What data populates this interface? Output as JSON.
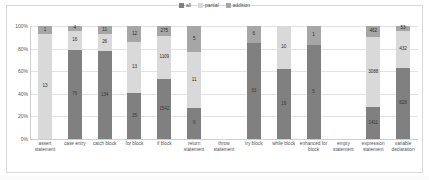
{
  "legend": {
    "position": "top-center",
    "items": [
      {
        "label": "all",
        "color": "#808080"
      },
      {
        "label": "partial",
        "color": "#d9d9d9"
      },
      {
        "label": "addition",
        "color": "#a6a6a6"
      }
    ]
  },
  "axis": {
    "y_ticks": [
      "0%",
      "20%",
      "40%",
      "60%",
      "80%",
      "100%"
    ],
    "ylabel": "",
    "xlabel": ""
  },
  "chart_data": {
    "type": "bar",
    "stacked": true,
    "normalized": true,
    "title": "",
    "subtitle": "",
    "xlabel": "",
    "ylabel": "",
    "ylim": [
      0,
      100
    ],
    "ytick_labels": [
      "0%",
      "20%",
      "40%",
      "60%",
      "80%",
      "100%"
    ],
    "grid": true,
    "legend_position": "top-center",
    "categories": [
      "assert statement",
      "case entry",
      "catch block",
      "for block",
      "if block",
      "return statement",
      "throw statement",
      "try block",
      "while block",
      "enhanced for block",
      "empty statement",
      "expression statement",
      "variable declaration"
    ],
    "series": [
      {
        "name": "all",
        "color": "#808080",
        "values": [
          0,
          76,
          134,
          1542,
          1542,
          6,
          0,
          33,
          16,
          5,
          0,
          1411,
          828
        ]
      },
      {
        "name": "partial",
        "color": "#d9d9d9",
        "values": [
          13,
          16,
          26,
          13,
          1109,
          11,
          0,
          0,
          10,
          0,
          0,
          3088,
          432
        ]
      },
      {
        "name": "addition",
        "color": "#a6a6a6",
        "values": [
          1,
          4,
          11,
          12,
          275,
          5,
          0,
          6,
          0,
          1,
          0,
          462,
          53
        ]
      }
    ],
    "bars": [
      {
        "category": "assert statement",
        "segments": [
          {
            "series": "all",
            "value": 0,
            "label": "",
            "percent": 0
          },
          {
            "series": "partial",
            "value": 13,
            "label": "13",
            "percent": 93
          },
          {
            "series": "addition",
            "value": 1,
            "label": "1",
            "percent": 7
          }
        ]
      },
      {
        "category": "case entry",
        "segments": [
          {
            "series": "all",
            "value": 76,
            "label": "76",
            "percent": 79
          },
          {
            "series": "partial",
            "value": 16,
            "label": "16",
            "percent": 17
          },
          {
            "series": "addition",
            "value": 4,
            "label": "4",
            "percent": 4
          }
        ]
      },
      {
        "category": "catch block",
        "segments": [
          {
            "series": "all",
            "value": 134,
            "label": "134",
            "percent": 78
          },
          {
            "series": "partial",
            "value": 26,
            "label": "26",
            "percent": 15
          },
          {
            "series": "addition",
            "value": 11,
            "label": "11",
            "percent": 7
          }
        ]
      },
      {
        "category": "for block",
        "segments": [
          {
            "series": "all",
            "value": 35,
            "label": "35",
            "percent": 41
          },
          {
            "series": "partial",
            "value": 13,
            "label": "13",
            "percent": 45
          },
          {
            "series": "addition",
            "value": 12,
            "label": "12",
            "percent": 14
          }
        ]
      },
      {
        "category": "if block",
        "segments": [
          {
            "series": "all",
            "value": 1542,
            "label": "1542",
            "percent": 53
          },
          {
            "series": "partial",
            "value": 1109,
            "label": "1109",
            "percent": 38
          },
          {
            "series": "addition",
            "value": 275,
            "label": "275",
            "percent": 9
          }
        ]
      },
      {
        "category": "return statement",
        "segments": [
          {
            "series": "all",
            "value": 6,
            "label": "6",
            "percent": 27
          },
          {
            "series": "partial",
            "value": 11,
            "label": "11",
            "percent": 50
          },
          {
            "series": "addition",
            "value": 5,
            "label": "5",
            "percent": 23
          }
        ]
      },
      {
        "category": "throw statement",
        "segments": []
      },
      {
        "category": "try block",
        "segments": [
          {
            "series": "all",
            "value": 33,
            "label": "33",
            "percent": 85
          },
          {
            "series": "partial",
            "value": 0,
            "label": "",
            "percent": 0
          },
          {
            "series": "addition",
            "value": 6,
            "label": "6",
            "percent": 15
          }
        ]
      },
      {
        "category": "while block",
        "segments": [
          {
            "series": "all",
            "value": 16,
            "label": "16",
            "percent": 62
          },
          {
            "series": "partial",
            "value": 10,
            "label": "10",
            "percent": 38
          },
          {
            "series": "addition",
            "value": 0,
            "label": "",
            "percent": 0
          }
        ]
      },
      {
        "category": "enhanced for block",
        "segments": [
          {
            "series": "all",
            "value": 5,
            "label": "5",
            "percent": 83
          },
          {
            "series": "partial",
            "value": 0,
            "label": "",
            "percent": 0
          },
          {
            "series": "addition",
            "value": 1,
            "label": "1",
            "percent": 17
          }
        ]
      },
      {
        "category": "empty statement",
        "segments": []
      },
      {
        "category": "expression statement",
        "segments": [
          {
            "series": "all",
            "value": 1411,
            "label": "1411",
            "percent": 28
          },
          {
            "series": "partial",
            "value": 3088,
            "label": "3088",
            "percent": 62
          },
          {
            "series": "addition",
            "value": 462,
            "label": "462",
            "percent": 10
          }
        ]
      },
      {
        "category": "variable declaration",
        "segments": [
          {
            "series": "all",
            "value": 828,
            "label": "828",
            "percent": 63
          },
          {
            "series": "partial",
            "value": 432,
            "label": "432",
            "percent": 33
          },
          {
            "series": "addition",
            "value": 53,
            "label": "53",
            "percent": 4
          }
        ]
      }
    ]
  }
}
